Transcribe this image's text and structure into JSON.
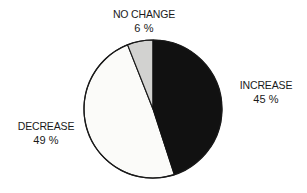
{
  "chart_data": {
    "type": "pie",
    "title": "",
    "subtitle": "",
    "xlabel": "",
    "ylabel": "",
    "legend_position": "none",
    "grid": false,
    "labels_outside": true,
    "start_angle_deg": 0,
    "direction": "clockwise",
    "categories": [
      "INCREASE",
      "DECREASE",
      "NO CHANGE"
    ],
    "values": [
      45,
      49,
      6
    ],
    "unit": "%",
    "slices": [
      {
        "name": "INCREASE",
        "label": "INCREASE",
        "value": 45,
        "value_text": "45 %",
        "color": "#111111",
        "fill_style": "solid-black",
        "start_angle_deg": 0,
        "end_angle_deg": 162,
        "label_position": "right"
      },
      {
        "name": "DECREASE",
        "label": "DECREASE",
        "value": 49,
        "value_text": "49 %",
        "color": "#fbfbf9",
        "fill_style": "white",
        "start_angle_deg": 162,
        "end_angle_deg": 338.4,
        "label_position": "left"
      },
      {
        "name": "NO CHANGE",
        "label": "NO CHANGE",
        "value": 6,
        "value_text": "6 %",
        "color": "#d2d2d0",
        "fill_style": "light-gray",
        "start_angle_deg": 338.4,
        "end_angle_deg": 360,
        "label_position": "top"
      }
    ],
    "stroke_color": "#1a1a1a",
    "background_color": "#ffffff"
  },
  "labels": {
    "increase": {
      "name": "INCREASE",
      "value": "45 %"
    },
    "decrease": {
      "name": "DECREASE",
      "value": "49 %"
    },
    "no_change": {
      "name": "NO CHANGE",
      "value": "6 %"
    }
  }
}
